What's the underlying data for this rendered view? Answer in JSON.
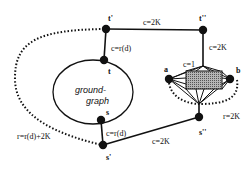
{
  "diagram": {
    "type": "graph",
    "ground_graph": {
      "label_line1": "ground-",
      "label_line2": "graph"
    },
    "nodes": {
      "t_prime": {
        "label": "t'"
      },
      "t_dprime": {
        "label": "t''"
      },
      "t": {
        "label": "t"
      },
      "s": {
        "label": "s"
      },
      "s_prime": {
        "label": "s'"
      },
      "s_dprime": {
        "label": "s''"
      },
      "a": {
        "label": "a"
      },
      "b": {
        "label": "b"
      }
    },
    "edge_labels": {
      "t_prime_t_dprime": "c=2K",
      "t_dprime_gadget": "c=2K",
      "t_prime_t": "c=r(d)",
      "s_s_prime": "c=r(d)",
      "s_prime_s_dprime": "c=2K",
      "gadget_top": "c=1",
      "a_b_request": "r=2K",
      "t_prime_s_prime_request": "r=r(d)+2K"
    },
    "colors": {
      "ink": "#111111",
      "gadget_fill": "#8a8a8a",
      "background": "#ffffff"
    }
  }
}
